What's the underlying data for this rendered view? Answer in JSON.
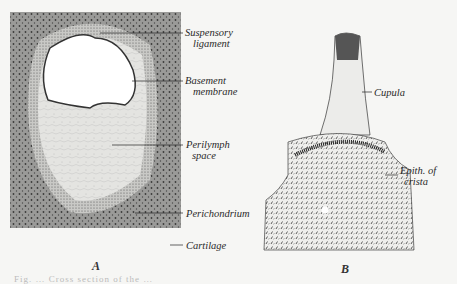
{
  "figure": {
    "panel_a": {
      "letter": "A",
      "labels": [
        {
          "id": "suspensory-ligament",
          "line1": "Suspensory",
          "line2": "ligament"
        },
        {
          "id": "basement-membrane",
          "line1": "Basement",
          "line2": "membrane"
        },
        {
          "id": "perilymph-space",
          "line1": "Perilymph",
          "line2": "space"
        },
        {
          "id": "perichondrium",
          "line1": "Perichondrium",
          "line2": ""
        },
        {
          "id": "cartilage",
          "line1": "Cartilage",
          "line2": ""
        }
      ]
    },
    "panel_b": {
      "letter": "B",
      "labels": [
        {
          "id": "cupula",
          "line1": "Cupula",
          "line2": ""
        },
        {
          "id": "epith-of-crista",
          "line1": "Epith. of",
          "line2": "crista"
        }
      ]
    },
    "caption_faint": "Fig. … Cross section of the …"
  }
}
